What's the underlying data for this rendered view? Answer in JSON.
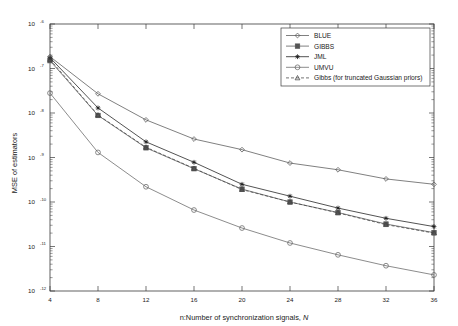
{
  "chart_data": {
    "type": "line",
    "title": "",
    "xlabel": "n:Number of synchronization signals, N",
    "xlabel_plain": "n:Number of synchronization signals,",
    "xlabel_italic": "N",
    "ylabel": "MSE of estimators",
    "xscale": "linear",
    "yscale": "log",
    "xlim": [
      4,
      36
    ],
    "ylim": [
      1e-12,
      1e-06
    ],
    "grid": false,
    "legend_position": "top-right",
    "x": [
      4,
      8,
      12,
      16,
      20,
      24,
      28,
      32,
      36
    ],
    "xticks": [
      4,
      8,
      12,
      16,
      20,
      24,
      28,
      32,
      36
    ],
    "xticklabels": [
      "4",
      "8",
      "12",
      "16",
      "20",
      "24",
      "28",
      "32",
      "36"
    ],
    "yticks": [
      1e-06,
      1e-07,
      1e-08,
      1e-09,
      1e-10,
      1e-11,
      1e-12
    ],
    "yticklabels": [
      "10",
      "10",
      "10",
      "10",
      "10",
      "10",
      "10"
    ],
    "ytickexponents": [
      "-6",
      "-7",
      "-8",
      "-9",
      "-10",
      "-11",
      "-12"
    ],
    "series": [
      {
        "name": "BLUE",
        "marker": "diamond",
        "linestyle": "solid",
        "color": "#555555",
        "values": [
          1.85e-07,
          2.7e-08,
          7e-09,
          2.6e-09,
          1.5e-09,
          7.5e-10,
          5.3e-10,
          3.3e-10,
          2.5e-10
        ]
      },
      {
        "name": "GIBBS",
        "marker": "square",
        "linestyle": "solid",
        "color": "#555555",
        "values": [
          1.5e-07,
          8.8e-09,
          1.65e-09,
          5.6e-10,
          1.95e-10,
          1e-10,
          5.8e-11,
          3.2e-11,
          2.05e-11
        ]
      },
      {
        "name": "JML",
        "marker": "star",
        "linestyle": "solid",
        "color": "#1a1a1a",
        "values": [
          1.75e-07,
          1.3e-08,
          2.25e-09,
          7.8e-10,
          2.5e-10,
          1.35e-10,
          7.3e-11,
          4.3e-11,
          2.8e-11
        ]
      },
      {
        "name": "UMVU",
        "marker": "circle",
        "linestyle": "solid",
        "color": "#666666",
        "values": [
          2.8e-08,
          1.3e-09,
          2.2e-10,
          6.6e-11,
          2.6e-11,
          1.2e-11,
          6.5e-12,
          3.7e-12,
          2.3e-12
        ]
      },
      {
        "name": "Gibbs (for truncated Gaussian priors)",
        "marker": "triangle",
        "linestyle": "dashed",
        "color": "#444444",
        "values": [
          1.6e-07,
          9e-09,
          1.7e-09,
          5.7e-10,
          1.9e-10,
          1e-10,
          5.7e-11,
          3.1e-11,
          2e-11
        ]
      }
    ]
  },
  "figure": {
    "background": "#ffffff",
    "axis_color": "#3a3a3a"
  }
}
